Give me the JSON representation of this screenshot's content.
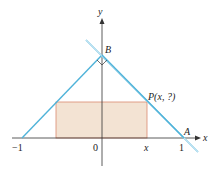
{
  "diagram": {
    "type": "geometry",
    "colors": {
      "lines": "#4fb3d9",
      "rectangle_fill": "#f3e3d3",
      "rectangle_stroke": "#d98a70",
      "axes": "#333333"
    },
    "axis_labels": {
      "x": "x",
      "y": "y"
    },
    "tick_labels": {
      "neg_one": "−1",
      "zero": "0",
      "x": "x",
      "one": "1"
    },
    "point_labels": {
      "B": "B",
      "A": "A",
      "P": "P(x, ?)"
    }
  }
}
